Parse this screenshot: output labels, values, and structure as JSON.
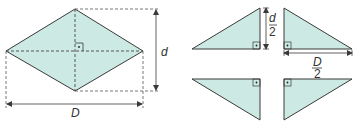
{
  "colors": {
    "fill": "#cce9e4",
    "stroke": "#3a3a3a",
    "dash": "#555555"
  },
  "rhombus": {
    "label_d": "d",
    "label_D": "D",
    "right_angle_marker": "right-angle"
  },
  "triangles": {
    "half_d_numerator": "d",
    "half_d_denominator": "2",
    "half_D_numerator": "D",
    "half_D_denominator": "2"
  }
}
